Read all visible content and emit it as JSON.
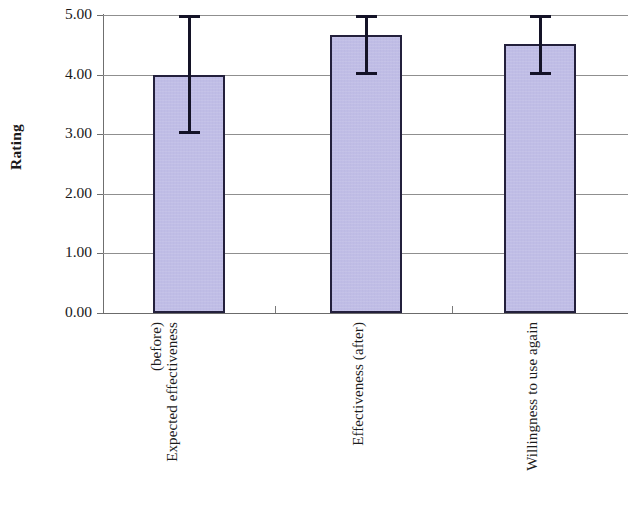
{
  "chart_data": {
    "type": "bar",
    "title": "",
    "xlabel": "",
    "ylabel": "Rating",
    "ylim": [
      0,
      5
    ],
    "ytick_step": 1,
    "ytick_labels": [
      "0.00",
      "1.00",
      "2.00",
      "3.00",
      "4.00",
      "5.00"
    ],
    "ytick_values": [
      0,
      1,
      2,
      3,
      4,
      5
    ],
    "grid": true,
    "legend": "none",
    "categories": [
      "Expected effectiveness (before)",
      "Effectiveness (after)",
      "Willingness to use again"
    ],
    "category_label_lines": [
      [
        "Expected effectiveness",
        "(before)"
      ],
      [
        "Effectiveness (after)"
      ],
      [
        "Willingness to use again"
      ]
    ],
    "values": [
      4.0,
      4.66,
      4.52
    ],
    "error_bars": [
      {
        "lower": 3.0,
        "upper": 5.0
      },
      {
        "lower": 4.0,
        "upper": 5.0
      },
      {
        "lower": 4.0,
        "upper": 5.0
      }
    ],
    "series": [
      {
        "name": "Rating",
        "values": [
          4.0,
          4.66,
          4.52
        ]
      }
    ],
    "colors": {
      "bar_fill": "#bbb8e4",
      "bar_border": "#23203c",
      "error_bar": "#141327",
      "gridline": "#8f8f8f",
      "axis": "#6f6f6f",
      "text": "#1a1a1a",
      "background": "#ffffff"
    }
  }
}
